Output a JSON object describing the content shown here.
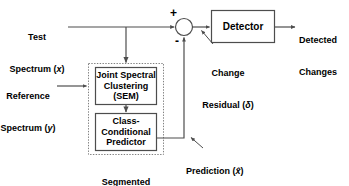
{
  "diagram": {
    "type": "block-diagram",
    "stroke_color": "#4d4d4d",
    "text_color": "#000000",
    "background": "#ffffff",
    "dashed_group_color": "#808080"
  },
  "inputs": {
    "test_spectrum_line1": "Test",
    "test_spectrum_line2": "Spectrum (",
    "test_spectrum_var": "x",
    "test_spectrum_close": ")",
    "reference_spectrum_line1": "Reference",
    "reference_spectrum_line2": "Spectrum (",
    "reference_spectrum_var": "y",
    "reference_spectrum_close": ")"
  },
  "blocks": {
    "joint_spectral": "Joint Spectral\nClustering\n(SEM)",
    "class_conditional": "Class-\nConditional\nPredictor",
    "detector": "Detector",
    "group_label_line1": "Segmented",
    "group_label_line2": "Predictor"
  },
  "junction": {
    "plus_sign": "+",
    "minus_sign": "-"
  },
  "annotations": {
    "change_residual_line1": "Change",
    "change_residual_line2": "Residual (",
    "change_residual_var": "δ",
    "change_residual_close": ")",
    "prediction_text": "Prediction (",
    "prediction_var": "x̂",
    "prediction_close": ")"
  },
  "outputs": {
    "detected_changes_line1": "Detected",
    "detected_changes_line2": "Changes"
  }
}
